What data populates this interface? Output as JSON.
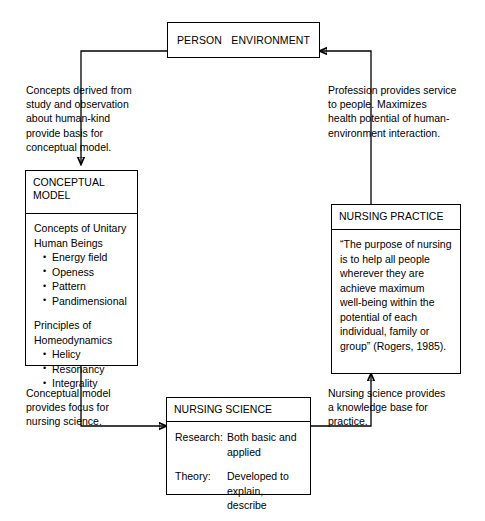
{
  "diagram": {
    "stroke_color": "#000000",
    "background_color": "#ffffff"
  },
  "person_environment_box": {
    "person_label": "PERSON",
    "environment_label": "ENVIRONMENT",
    "relation_icon": "double-headed-arrow-icon"
  },
  "notes": {
    "derived_from": "Concepts derived from\nstudy and observation\nabout human-kind\nprovide basis for\nconceptual model.",
    "profession_service": "Profession provides service\nto people. Maximizes\nhealth potential of human-\nenvironment interaction.",
    "model_focus": "Conceptual model\nprovides focus for\nnursing science.",
    "knowledge_base": "Nursing science provides\na knowledge base for\npractice."
  },
  "conceptual_model": {
    "header_line1": "CONCEPTUAL",
    "header_line2": "MODEL",
    "group1_title_line1": "Concepts of Unitary",
    "group1_title_line2": "Human Beings",
    "group1_items": [
      "Energy field",
      "Openess",
      "Pattern",
      "Pandimensional"
    ],
    "group2_title_line1": "Principles of",
    "group2_title_line2": "Homeodynamics",
    "group2_items": [
      "Helicy",
      "Resonancy",
      "Integrality"
    ]
  },
  "nursing_practice": {
    "header": "NURSING PRACTICE",
    "quote": "“The purpose of nursing\nis to help all people\nwherever they are\nachieve maximum\nwell-being within the\npotential of each\nindividual, family or\ngroup” (Rogers, 1985)."
  },
  "nursing_science": {
    "header": "NURSING SCIENCE",
    "rows": [
      {
        "key": "Research:",
        "value": "Both basic and\napplied"
      },
      {
        "key": "Theory:",
        "value": "Developed to\nexplain, describe"
      }
    ]
  }
}
